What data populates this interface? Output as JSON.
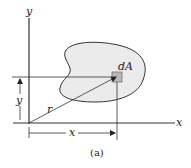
{
  "diagram": {
    "labels": {
      "y_axis": "y",
      "x_axis": "x",
      "element": "dA",
      "radius": "r",
      "x_dim": "x",
      "y_dim": "y"
    },
    "caption": "(a)",
    "colors": {
      "region_fill": "#ebebeb",
      "element_fill": "#b8b8b8",
      "line": "#333333"
    }
  }
}
